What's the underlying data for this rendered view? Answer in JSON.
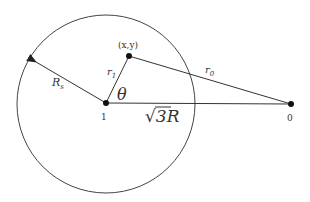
{
  "diagram": {
    "type": "geometry",
    "circle_label": "R_s",
    "points": {
      "center": {
        "label": "1"
      },
      "field_point": {
        "label": "(x,y)"
      },
      "source": {
        "label": "0"
      }
    },
    "labels": {
      "radius": "R",
      "radius_sub": "s",
      "r1": "r",
      "r1_sub": "1",
      "r0": "r",
      "r0_sub": "0",
      "theta": "θ",
      "distance_sqrt": "√",
      "distance_value": "3R"
    },
    "relations": [
      {
        "from": "center",
        "to": "field_point",
        "label": "r1"
      },
      {
        "from": "field_point",
        "to": "source",
        "label": "r0"
      },
      {
        "from": "center",
        "to": "source",
        "label": "√3R"
      },
      {
        "from": "center",
        "to": "circle-edge",
        "label": "Rs",
        "arrow": true
      }
    ],
    "colors": {
      "stroke": "#333333",
      "background": "#ffffff"
    }
  }
}
